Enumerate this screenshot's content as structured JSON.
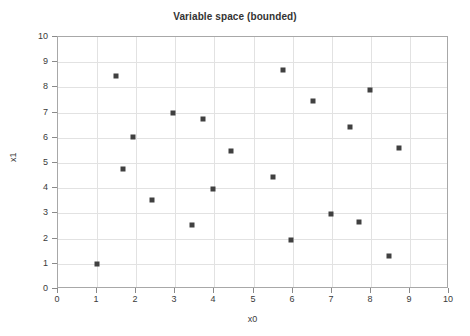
{
  "chart_data": {
    "type": "scatter",
    "title": "Variable space (bounded)",
    "xlabel": "x0",
    "ylabel": "x1",
    "xlim": [
      0,
      10
    ],
    "ylim": [
      0,
      10
    ],
    "xticks": [
      "0",
      "1",
      "2",
      "3",
      "4",
      "5",
      "6",
      "7",
      "8",
      "9",
      "10"
    ],
    "yticks": [
      "0",
      "1",
      "2",
      "3",
      "4",
      "5",
      "6",
      "7",
      "8",
      "9",
      "10"
    ],
    "grid": true,
    "legend": null,
    "marker": {
      "shape": "square",
      "color": "#404040",
      "size_px": 5
    },
    "series": [
      {
        "name": "samples",
        "points": [
          {
            "x": 1.0,
            "y": 1.0
          },
          {
            "x": 1.48,
            "y": 8.45
          },
          {
            "x": 1.66,
            "y": 4.76
          },
          {
            "x": 1.92,
            "y": 6.03
          },
          {
            "x": 2.4,
            "y": 3.53
          },
          {
            "x": 2.94,
            "y": 6.98
          },
          {
            "x": 3.43,
            "y": 2.54
          },
          {
            "x": 3.71,
            "y": 6.75
          },
          {
            "x": 3.96,
            "y": 3.97
          },
          {
            "x": 4.43,
            "y": 5.48
          },
          {
            "x": 5.5,
            "y": 4.44
          },
          {
            "x": 5.76,
            "y": 8.69
          },
          {
            "x": 5.96,
            "y": 1.94
          },
          {
            "x": 6.52,
            "y": 7.46
          },
          {
            "x": 6.98,
            "y": 2.97
          },
          {
            "x": 7.47,
            "y": 6.43
          },
          {
            "x": 7.7,
            "y": 2.66
          },
          {
            "x": 7.98,
            "y": 7.9
          },
          {
            "x": 8.46,
            "y": 1.31
          },
          {
            "x": 8.72,
            "y": 5.6
          }
        ]
      }
    ]
  },
  "colors": {
    "marker": "#404040",
    "grid": "#e2e2e2",
    "frame": "#a8a8a8",
    "text": "#3a3a3a",
    "background": "#ffffff"
  }
}
